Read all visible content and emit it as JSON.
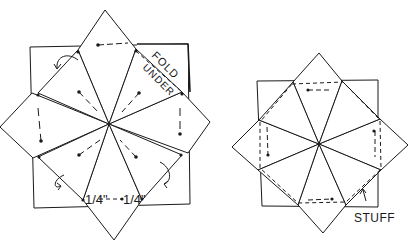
{
  "figure_left": {
    "label_fold": "FOLD",
    "label_under": "UNDER",
    "measure_left": "1/4\"",
    "measure_right": "1/4\""
  },
  "figure_right": {
    "label_stuff": "STUFF"
  },
  "colors": {
    "ink": "#1a1a1a",
    "paper": "#ffffff",
    "stipple": "#9a9a9a"
  }
}
